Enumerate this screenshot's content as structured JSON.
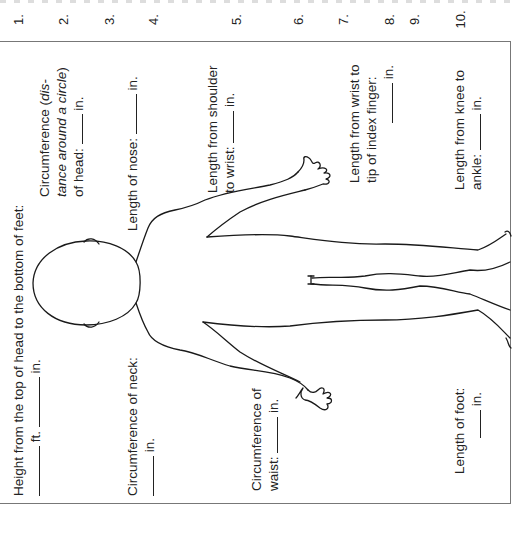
{
  "numbers": [
    "1.",
    "2.",
    "3.",
    "4.",
    "5.",
    "6.",
    "7.",
    "8.",
    "9.",
    "10."
  ],
  "labels": {
    "height": {
      "line1": "Height from the top of head to the bottom of feet:",
      "ft": "ft.",
      "in": "in."
    },
    "head": {
      "line1": "Circumference (",
      "line1_italic": "dis-",
      "line2_italic": "tance around a circle",
      "line2_end": ")",
      "line3": "of head:",
      "in": "in."
    },
    "nose": {
      "text": "Length of nose:",
      "in": "in."
    },
    "neck": {
      "text": "Circumference of neck:",
      "in": "in."
    },
    "shoulder_wrist": {
      "line1": "Length from shoulder",
      "line2": "to wrist:",
      "in": "in."
    },
    "waist": {
      "line1": "Circumference of",
      "line2": "waist:",
      "in": "in."
    },
    "wrist_finger": {
      "line1": "Length from wrist to",
      "line2": "tip of index finger:",
      "in": "in."
    },
    "knee_ankle": {
      "line1": "Length from knee to",
      "line2": "ankle:",
      "in": "in."
    },
    "foot": {
      "text": "Length of foot:",
      "in": "in."
    }
  },
  "figure": {
    "icon": "human-body-outline",
    "stroke_color": "#1a1a1a"
  },
  "border_color": "#777777"
}
